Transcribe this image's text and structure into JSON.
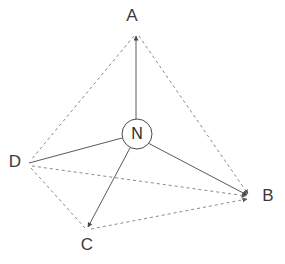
{
  "diagram": {
    "title": "",
    "type": "tetrahedral-geometry-diagram",
    "background_color": "#ffffff",
    "center": {
      "label": "N",
      "x": 137,
      "y": 134,
      "radius": 15,
      "stroke_color": "#4a4a4a",
      "fill_color": "#ffffff"
    },
    "vertices": [
      {
        "id": "A",
        "label": "A",
        "x": 136,
        "y": 33,
        "label_x": 132,
        "label_y": 17
      },
      {
        "id": "B",
        "label": "B",
        "x": 251,
        "y": 197,
        "label_x": 268,
        "label_y": 197
      },
      {
        "id": "C",
        "label": "C",
        "x": 87,
        "y": 230,
        "label_x": 87,
        "label_y": 246
      },
      {
        "id": "D",
        "label": "D",
        "x": 29,
        "y": 163,
        "label_x": 15,
        "label_y": 163
      }
    ],
    "bonds": [
      {
        "id": "N-A",
        "from": "N",
        "to": "A",
        "style": "solid",
        "arrow": true,
        "color": "#5a5a5a"
      },
      {
        "id": "N-B",
        "from": "N",
        "to": "B",
        "style": "solid",
        "arrow": true,
        "color": "#5a5a5a"
      },
      {
        "id": "N-C",
        "from": "N",
        "to": "C",
        "style": "solid",
        "arrow": true,
        "color": "#5a5a5a"
      },
      {
        "id": "N-D",
        "from": "N",
        "to": "D",
        "style": "solid",
        "arrow": false,
        "color": "#5a5a5a"
      }
    ],
    "edges": [
      {
        "id": "A-B",
        "from": "A",
        "to": "B",
        "style": "dashed",
        "arrow": true,
        "color": "#8a8a8a"
      },
      {
        "id": "A-D",
        "from": "A",
        "to": "D",
        "style": "dashed",
        "arrow": false,
        "color": "#8a8a8a"
      },
      {
        "id": "A-C",
        "from": "A",
        "to": "C",
        "style": "none",
        "arrow": false,
        "color": "#8a8a8a"
      },
      {
        "id": "D-B",
        "from": "D",
        "to": "B",
        "style": "dashed",
        "arrow": true,
        "color": "#8a8a8a"
      },
      {
        "id": "D-C",
        "from": "D",
        "to": "C",
        "style": "dashed",
        "arrow": false,
        "color": "#8a8a8a"
      },
      {
        "id": "C-B",
        "from": "C",
        "to": "B",
        "style": "dashed",
        "arrow": true,
        "color": "#8a8a8a"
      }
    ],
    "dash_pattern": "3,3",
    "solid_stroke_width": 1,
    "dashed_stroke_width": 1
  }
}
